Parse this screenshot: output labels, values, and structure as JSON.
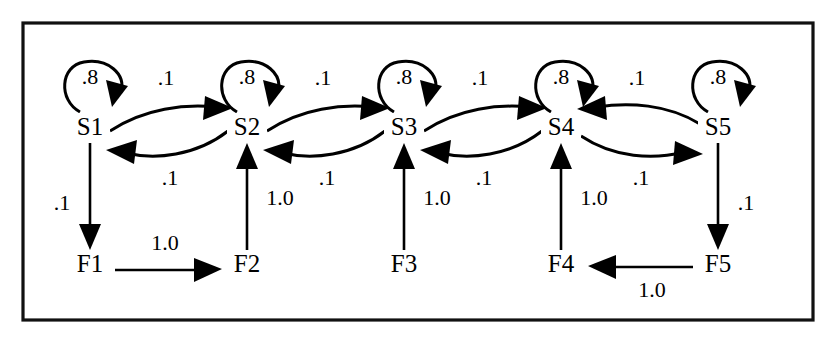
{
  "diagram": {
    "type": "state-transition-diagram",
    "frame": {
      "border_color": "#111111",
      "background": "#ffffff"
    },
    "states": [
      {
        "id": "S1",
        "label": "S1",
        "row": "top",
        "x": 90,
        "y": 128
      },
      {
        "id": "S2",
        "label": "S2",
        "row": "top",
        "x": 247,
        "y": 128
      },
      {
        "id": "S3",
        "label": "S3",
        "row": "top",
        "x": 404,
        "y": 128
      },
      {
        "id": "S4",
        "label": "S4",
        "row": "top",
        "x": 561,
        "y": 128
      },
      {
        "id": "S5",
        "label": "S5",
        "row": "top",
        "x": 718,
        "y": 128
      },
      {
        "id": "F1",
        "label": "F1",
        "row": "bottom",
        "x": 90,
        "y": 265
      },
      {
        "id": "F2",
        "label": "F2",
        "row": "bottom",
        "x": 247,
        "y": 265
      },
      {
        "id": "F3",
        "label": "F3",
        "row": "bottom",
        "x": 404,
        "y": 265
      },
      {
        "id": "F4",
        "label": "F4",
        "row": "bottom",
        "x": 561,
        "y": 265
      },
      {
        "id": "F5",
        "label": "F5",
        "row": "bottom",
        "x": 718,
        "y": 265
      }
    ],
    "self_loops": [
      {
        "id": "loop-s1",
        "state": "S1",
        "weight": ".8"
      },
      {
        "id": "loop-s2",
        "state": "S2",
        "weight": ".8"
      },
      {
        "id": "loop-s3",
        "state": "S3",
        "weight": ".8"
      },
      {
        "id": "loop-s4",
        "state": "S4",
        "weight": ".8"
      },
      {
        "id": "loop-s5",
        "state": "S5",
        "weight": ".8"
      }
    ],
    "transitions": [
      {
        "id": "s1-s2",
        "from": "S1",
        "to": "S2",
        "weight": ".1",
        "kind": "curve-top"
      },
      {
        "id": "s2-s1",
        "from": "S2",
        "to": "S1",
        "weight": ".1",
        "kind": "curve-bottom"
      },
      {
        "id": "s2-s3",
        "from": "S2",
        "to": "S3",
        "weight": ".1",
        "kind": "curve-top"
      },
      {
        "id": "s3-s2",
        "from": "S3",
        "to": "S2",
        "weight": ".1",
        "kind": "curve-bottom"
      },
      {
        "id": "s3-s4",
        "from": "S3",
        "to": "S4",
        "weight": ".1",
        "kind": "curve-top"
      },
      {
        "id": "s4-s3",
        "from": "S4",
        "to": "S3",
        "weight": ".1",
        "kind": "curve-bottom"
      },
      {
        "id": "s4-s5",
        "from": "S4",
        "to": "S5",
        "weight": ".1",
        "kind": "curve-bottom"
      },
      {
        "id": "s5-s4",
        "from": "S5",
        "to": "S4",
        "weight": ".1",
        "kind": "curve-top"
      },
      {
        "id": "s1-f1",
        "from": "S1",
        "to": "F1",
        "weight": ".1",
        "kind": "vertical-down"
      },
      {
        "id": "s5-f5",
        "from": "S5",
        "to": "F5",
        "weight": ".1",
        "kind": "vertical-down"
      },
      {
        "id": "f2-s2",
        "from": "F2",
        "to": "S2",
        "weight": "1.0",
        "kind": "vertical-up"
      },
      {
        "id": "f3-s3",
        "from": "F3",
        "to": "S3",
        "weight": "1.0",
        "kind": "vertical-up"
      },
      {
        "id": "f4-s4",
        "from": "F4",
        "to": "S4",
        "weight": "1.0",
        "kind": "vertical-up"
      },
      {
        "id": "f1-f2",
        "from": "F1",
        "to": "F2",
        "weight": "1.0",
        "kind": "horizontal-right"
      },
      {
        "id": "f5-f4",
        "from": "F5",
        "to": "F4",
        "weight": "1.0",
        "kind": "horizontal-left"
      }
    ]
  },
  "labels": {
    "s1": "S1",
    "s2": "S2",
    "s3": "S3",
    "s4": "S4",
    "s5": "S5",
    "f1": "F1",
    "f2": "F2",
    "f3": "F3",
    "f4": "F4",
    "f5": "F5",
    "loop1": ".8",
    "loop2": ".8",
    "loop3": ".8",
    "loop4": ".8",
    "loop5": ".8",
    "t_s1s2": ".1",
    "t_s2s1": ".1",
    "t_s2s3": ".1",
    "t_s3s2": ".1",
    "t_s3s4": ".1",
    "t_s4s3": ".1",
    "t_s4s5": ".1",
    "t_s5s4": ".1",
    "t_s1f1": ".1",
    "t_s5f5": ".1",
    "t_f2s2": "1.0",
    "t_f3s3": "1.0",
    "t_f4s4": "1.0",
    "t_f1f2": "1.0",
    "t_f5f4": "1.0"
  }
}
